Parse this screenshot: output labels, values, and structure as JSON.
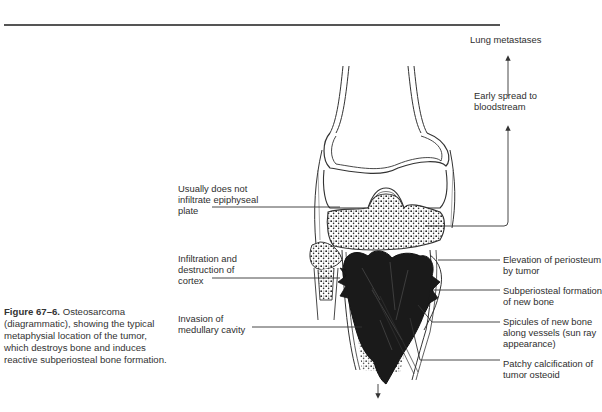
{
  "figure": {
    "label": "Figure 67–6.",
    "caption": "Osteosarcoma (diagrammatic), showing the typical metaphysial location of the tumor, which destroys bone and induces reactive subperiosteal bone formation."
  },
  "labels_left": {
    "epiphyseal": "Usually does not\ninfiltrate epiphyseal\nplate",
    "cortex": "Infiltration and\ndestruction of\ncortex",
    "medullary": "Invasion of\nmedullary cavity"
  },
  "labels_top_right": {
    "lung": "Lung metastases",
    "bloodstream": "Early spread to\nbloodstream"
  },
  "labels_right": {
    "periosteum": "Elevation of periosteum\nby tumor",
    "subperiosteal": "Subperiosteal formation\nof new bone",
    "spicules": "Spicules of new bone\nalong vessels (sun ray\nappearance)",
    "calcification": "Patchy calcification of\ntumor osteoid"
  }
}
